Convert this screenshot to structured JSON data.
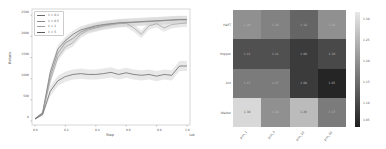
{
  "chart_data": [
    {
      "type": "line",
      "title": "",
      "xlabel": "Step",
      "xlabel_offset": "1e6",
      "ylabel": "Return",
      "xlim": [
        0.0,
        1.0
      ],
      "ylim": [
        0,
        2600
      ],
      "grid": false,
      "legend_position": "upper left",
      "x_ticks": [
        "0.0",
        "0.2",
        "0.4",
        "0.6",
        "0.8",
        "1.0"
      ],
      "y_ticks": [
        "0",
        "500",
        "1000",
        "1500",
        "2000",
        "2500"
      ],
      "x": [
        0.0,
        0.05,
        0.1,
        0.15,
        0.2,
        0.25,
        0.3,
        0.35,
        0.4,
        0.45,
        0.5,
        0.55,
        0.6,
        0.65,
        0.7,
        0.75,
        0.8,
        0.85,
        0.9,
        0.95,
        1.0
      ],
      "series": [
        {
          "name": "λ = 0.1",
          "values": [
            50,
            200,
            1150,
            1700,
            1900,
            2050,
            2150,
            2200,
            2250,
            2280,
            2300,
            2320,
            2330,
            2340,
            2350,
            2360,
            2370,
            2380,
            2390,
            2400,
            2400
          ]
        },
        {
          "name": "λ = 0.5",
          "values": [
            50,
            180,
            1050,
            1600,
            1850,
            1950,
            2100,
            2180,
            2220,
            2260,
            2290,
            2310,
            2320,
            2330,
            2340,
            2350,
            2360,
            2370,
            2380,
            2390,
            2390
          ]
        },
        {
          "name": "λ = 1",
          "values": [
            50,
            170,
            950,
            1500,
            1750,
            1850,
            2050,
            2150,
            2200,
            2240,
            2270,
            2300,
            2310,
            2200,
            2050,
            2250,
            2300,
            2200,
            2280,
            2300,
            2320
          ]
        },
        {
          "name": "λ = 5",
          "values": [
            50,
            150,
            700,
            950,
            1050,
            1100,
            1120,
            1100,
            1100,
            1120,
            1150,
            1100,
            1140,
            1100,
            1080,
            1100,
            1060,
            1100,
            1080,
            1300,
            1300
          ]
        }
      ]
    },
    {
      "type": "heatmap",
      "title": "",
      "rows": [
        "HalfT",
        "Hopper",
        "Ant",
        "Walker"
      ],
      "columns": [
        "pnn_1",
        "pnn_5",
        "pnn_10",
        "pnn_50"
      ],
      "values": [
        [
          1.2,
          1.18,
          1.14,
          1.2
        ],
        [
          1.11,
          1.11,
          1.08,
          1.1
        ],
        [
          1.17,
          1.17,
          1.08,
          1.05
        ],
        [
          1.3,
          1.2,
          1.26,
          1.17
        ]
      ],
      "colorbar_ticks": [
        "1.30",
        "1.25",
        "1.20",
        "1.15",
        "1.10",
        "1.05"
      ],
      "colormap": "gray",
      "vmin": 1.04,
      "vmax": 1.32
    }
  ],
  "line_chart": {
    "xlabel": "Step",
    "xoffset": "1e6",
    "ylabel": "Return",
    "x_ticks": [
      "0.0",
      "0.2",
      "0.4",
      "0.6",
      "0.8",
      "1.0"
    ],
    "y_ticks": [
      "0",
      "500",
      "1000",
      "1500",
      "2000",
      "2500"
    ],
    "legend": [
      "λ = 0.1",
      "λ = 0.5",
      "λ = 1",
      "λ = 5"
    ]
  },
  "heatmap": {
    "rows": [
      "HalfT",
      "Hopper",
      "Ant",
      "Walker"
    ],
    "columns": [
      "pnn_1",
      "pnn_5",
      "pnn_10",
      "pnn_50"
    ],
    "cells": [
      [
        "1.20",
        "1.18",
        "1.14",
        "1.20"
      ],
      [
        "1.11",
        "1.11",
        "1.08",
        "1.10"
      ],
      [
        "1.17",
        "1.17",
        "1.08",
        "1.05"
      ],
      [
        "1.30",
        "1.20",
        "1.26",
        "1.17"
      ]
    ],
    "colorbar_ticks": [
      "1.30",
      "1.25",
      "1.20",
      "1.15",
      "1.10",
      "1.05"
    ]
  },
  "colors": {
    "series": [
      "#6a6a6a",
      "#8a8a8a",
      "#a0a0a0",
      "#5c5c5c"
    ],
    "band": "#d6d6d6",
    "frame": "#bdbdbd"
  }
}
